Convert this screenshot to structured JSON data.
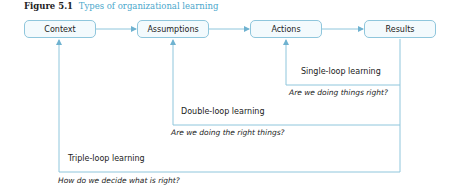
{
  "figure": {
    "number": "Figure 5.1",
    "title": "Types of organizational learning",
    "accent_color": "#4aa7cc",
    "line_color": "#8fc6dc"
  },
  "boxes": [
    {
      "label": "Context"
    },
    {
      "label": "Assumptions"
    },
    {
      "label": "Actions"
    },
    {
      "label": "Results"
    }
  ],
  "loops": [
    {
      "label": "Single-loop learning",
      "question": "Are we doing things right?",
      "returns_to": "Actions"
    },
    {
      "label": "Double-loop learning",
      "question": "Are we doing the right things?",
      "returns_to": "Assumptions"
    },
    {
      "label": "Triple-loop learning",
      "question": "How do we decide what is right?",
      "returns_to": "Context"
    }
  ]
}
